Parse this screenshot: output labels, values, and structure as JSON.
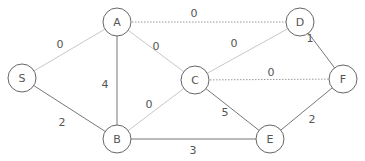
{
  "diagram": {
    "type": "weighted-undirected-graph",
    "nodes": [
      {
        "id": "S",
        "label": "S",
        "x": 22,
        "y": 78
      },
      {
        "id": "A",
        "label": "A",
        "x": 117,
        "y": 22
      },
      {
        "id": "D",
        "label": "D",
        "x": 300,
        "y": 22
      },
      {
        "id": "C",
        "label": "C",
        "x": 195,
        "y": 80
      },
      {
        "id": "F",
        "label": "F",
        "x": 343,
        "y": 79
      },
      {
        "id": "B",
        "label": "B",
        "x": 117,
        "y": 139
      },
      {
        "id": "E",
        "label": "E",
        "x": 270,
        "y": 139
      }
    ],
    "edges": [
      {
        "from": "S",
        "to": "A",
        "weight": "0",
        "style": "light",
        "lx": 60,
        "ly": 44
      },
      {
        "from": "S",
        "to": "B",
        "weight": "2",
        "style": "solid",
        "lx": 62,
        "ly": 122
      },
      {
        "from": "A",
        "to": "D",
        "weight": "0",
        "style": "dotted",
        "lx": 194,
        "ly": 13
      },
      {
        "from": "A",
        "to": "C",
        "weight": "0",
        "style": "light",
        "lx": 156,
        "ly": 46
      },
      {
        "from": "A",
        "to": "B",
        "weight": "4",
        "style": "solid",
        "lx": 105,
        "ly": 84
      },
      {
        "from": "D",
        "to": "C",
        "weight": "0",
        "style": "light",
        "lx": 234,
        "ly": 43
      },
      {
        "from": "D",
        "to": "F",
        "weight": "1",
        "style": "solid",
        "lx": 310,
        "ly": 38
      },
      {
        "from": "C",
        "to": "F",
        "weight": "0",
        "style": "dotted",
        "lx": 271,
        "ly": 72
      },
      {
        "from": "C",
        "to": "B",
        "weight": "0",
        "style": "light",
        "lx": 149,
        "ly": 104
      },
      {
        "from": "C",
        "to": "E",
        "weight": "5",
        "style": "solid",
        "lx": 225,
        "ly": 112
      },
      {
        "from": "B",
        "to": "E",
        "weight": "3",
        "style": "solid",
        "lx": 193,
        "ly": 150
      },
      {
        "from": "E",
        "to": "F",
        "weight": "2",
        "style": "solid",
        "lx": 312,
        "ly": 119
      }
    ]
  },
  "colors": {
    "node_stroke": "#666666",
    "solid_edge": "#777777",
    "light_edge": "#c8c8c8",
    "dotted_edge": "#999999",
    "text": "#555555"
  }
}
